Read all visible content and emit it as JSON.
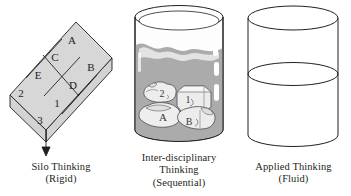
{
  "figure": {
    "background_color": "#ffffff",
    "line_color": "#231f20",
    "fill_color": "#d8d8d8",
    "liquid_color": "#ababab",
    "rock_color": "#e8e8e8"
  },
  "panels": [
    {
      "id": "silo",
      "caption_lines": [
        "Silo Thinking",
        "(Rigid)"
      ],
      "diagram": {
        "kind": "isometric-grid-slab",
        "grid_rows": 2,
        "grid_cols": 4,
        "cell_labels_upper_row": [
          "2",
          "E",
          "C",
          "A"
        ],
        "cell_labels_lower_row": [
          "3",
          "1",
          "D",
          "B"
        ],
        "cells": [
          "A",
          "B",
          "C",
          "D",
          "E",
          "1",
          "2",
          "3"
        ]
      }
    },
    {
      "id": "inter",
      "caption_lines": [
        "Inter-disciplinary",
        "Thinking",
        "(Sequential)"
      ],
      "diagram": {
        "kind": "glass-with-liquid-and-rocks",
        "liquid_level_percent": 72,
        "rock_labels": [
          "2",
          "1",
          "A",
          "B"
        ],
        "highlight_count": 4
      }
    },
    {
      "id": "app",
      "caption_lines": [
        "Applied Thinking",
        "(Fluid)"
      ],
      "diagram": {
        "kind": "open-cylinder-with-fluid-line",
        "fluid_level_percent": 58
      }
    }
  ]
}
